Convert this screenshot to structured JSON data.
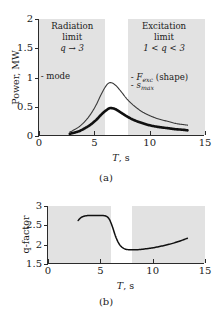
{
  "figure": {
    "panel_a": {
      "caption": "(a)",
      "axes": {
        "xlabel_symbol": "T",
        "xlabel_unit": ", s",
        "ylabel": "Power, MW",
        "xticks": [
          "0",
          "5",
          "10",
          "15"
        ],
        "xtick_values": [
          0,
          5,
          10,
          15
        ],
        "yticks": [
          "0",
          "0.5",
          "1",
          "1.5",
          "2"
        ],
        "ytick_values": [
          0,
          0.5,
          1,
          1.5,
          2
        ],
        "xlim": [
          0,
          15
        ],
        "ylim": [
          0,
          2
        ]
      },
      "bands": [
        {
          "name": "radiation-limit-band",
          "x_start": 0,
          "x_end": 6.0,
          "color": "#e2e2e2",
          "note_line1": "Radiation",
          "note_line2": "limit",
          "note_line3": "q → 3"
        },
        {
          "name": "excitation-limit-band",
          "x_start": 8.0,
          "x_end": 15.0,
          "color": "#e2e2e2",
          "note_line1": "Excitation",
          "note_line2": "limit",
          "note_line3": "1 < q < 3"
        }
      ],
      "legend_left": "- mode",
      "legend_right_1_dash": "- ",
      "legend_right_1_sym": "F",
      "legend_right_1_sub": "exc",
      "legend_right_1_tail": " (shape)",
      "legend_right_2_dash": "- ",
      "legend_right_2_sym": "s",
      "legend_right_2_sub": "max"
    },
    "panel_b": {
      "caption": "(b)",
      "axes": {
        "xlabel_symbol": "T",
        "xlabel_unit": ", s",
        "ylabel": "q-factor",
        "xticks": [
          "0",
          "5",
          "10",
          "15"
        ],
        "xtick_values": [
          0,
          5,
          10,
          15
        ],
        "yticks": [
          "1.5",
          "2",
          "2.5",
          "3"
        ],
        "ytick_values": [
          1.5,
          2,
          2.5,
          3
        ],
        "xlim": [
          0,
          15
        ],
        "ylim": [
          1.5,
          3
        ]
      },
      "bands": [
        {
          "name": "radiation-limit-band",
          "x_start": 0,
          "x_end": 6.0,
          "color": "#e2e2e2"
        },
        {
          "name": "excitation-limit-band",
          "x_start": 8.0,
          "x_end": 15.0,
          "color": "#e2e2e2"
        }
      ]
    }
  },
  "chart_data": [
    {
      "type": "line",
      "name": "panel-a-power",
      "title": "",
      "xlabel": "T, s",
      "ylabel": "Power, MW",
      "xlim": [
        0,
        15
      ],
      "ylim": [
        0,
        2
      ],
      "grid": false,
      "legend_position": "inside-top",
      "shaded_regions": [
        {
          "label": "Radiation limit, q → 3",
          "x_range": [
            0,
            6.0
          ]
        },
        {
          "label": "Excitation limit, 1 < q < 3",
          "x_range": [
            8.0,
            15.0
          ]
        }
      ],
      "series": [
        {
          "name": "F_exc (shape)",
          "style": "thin",
          "x": [
            2.8,
            3.2,
            3.7,
            4.2,
            4.7,
            5.2,
            5.6,
            6.0,
            6.3,
            6.6,
            7.0,
            7.5,
            8.0,
            8.6,
            9.3,
            10.0,
            10.8,
            11.6,
            12.4,
            13.1,
            13.5
          ],
          "y": [
            0.05,
            0.09,
            0.15,
            0.24,
            0.36,
            0.52,
            0.68,
            0.82,
            0.89,
            0.9,
            0.85,
            0.74,
            0.62,
            0.51,
            0.41,
            0.34,
            0.28,
            0.24,
            0.2,
            0.18,
            0.17
          ]
        },
        {
          "name": "s_max",
          "style": "thick",
          "x": [
            2.8,
            3.2,
            3.7,
            4.2,
            4.7,
            5.2,
            5.6,
            6.0,
            6.4,
            6.7,
            7.0,
            7.5,
            8.0,
            8.6,
            9.3,
            10.0,
            10.8,
            11.6,
            12.4,
            13.1,
            13.5
          ],
          "y": [
            0.02,
            0.04,
            0.07,
            0.12,
            0.18,
            0.26,
            0.34,
            0.41,
            0.46,
            0.46,
            0.44,
            0.38,
            0.32,
            0.26,
            0.21,
            0.17,
            0.14,
            0.12,
            0.1,
            0.09,
            0.08
          ]
        }
      ]
    },
    {
      "type": "line",
      "name": "panel-b-q-factor",
      "title": "",
      "xlabel": "T, s",
      "ylabel": "q-factor",
      "xlim": [
        0,
        15
      ],
      "ylim": [
        1.5,
        3
      ],
      "grid": false,
      "shaded_regions": [
        {
          "label": "Radiation limit",
          "x_range": [
            0,
            6.0
          ]
        },
        {
          "label": "Excitation limit",
          "x_range": [
            8.0,
            15.0
          ]
        }
      ],
      "series": [
        {
          "name": "q-factor",
          "style": "medium",
          "x": [
            2.9,
            3.2,
            3.6,
            4.0,
            4.6,
            5.2,
            5.6,
            5.9,
            6.2,
            6.5,
            6.8,
            7.1,
            7.5,
            8.0,
            8.6,
            9.3,
            10.1,
            11.0,
            11.9,
            12.7,
            13.4
          ],
          "y": [
            2.62,
            2.7,
            2.74,
            2.75,
            2.75,
            2.75,
            2.73,
            2.65,
            2.45,
            2.2,
            2.02,
            1.92,
            1.86,
            1.85,
            1.85,
            1.87,
            1.9,
            1.95,
            2.01,
            2.08,
            2.15
          ]
        }
      ]
    }
  ]
}
